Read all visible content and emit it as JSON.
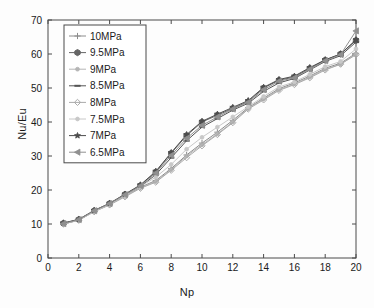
{
  "chart_data": {
    "type": "line",
    "title": "",
    "subtitle": "",
    "xlabel": "Np",
    "ylabel": "Nu/Eu",
    "xlim": [
      0,
      20
    ],
    "ylim": [
      0,
      70
    ],
    "xticks": [
      0,
      2,
      4,
      6,
      8,
      10,
      12,
      14,
      16,
      18,
      20
    ],
    "yticks": [
      0,
      10,
      20,
      30,
      40,
      50,
      60,
      70
    ],
    "grid": false,
    "legend_position": "upper-left-inside",
    "x": [
      1,
      2,
      3,
      4,
      5,
      6,
      7,
      8,
      9,
      10,
      11,
      12,
      13,
      14,
      15,
      16,
      17,
      18,
      19,
      20
    ],
    "series": [
      {
        "name": "10MPa",
        "marker": "plus",
        "color": "#8c8c8c",
        "values": [
          10.0,
          11.2,
          13.8,
          15.8,
          18.3,
          20.8,
          22.8,
          26.3,
          30.3,
          33.8,
          37.0,
          40.5,
          44.2,
          47.0,
          49.8,
          51.5,
          53.5,
          55.8,
          57.3,
          60.2
        ]
      },
      {
        "name": "9.5MPa",
        "marker": "hexagon",
        "color": "#666666",
        "values": [
          10.2,
          11.3,
          13.9,
          16.0,
          18.7,
          21.3,
          25.3,
          30.8,
          36.0,
          40.0,
          42.0,
          44.0,
          46.0,
          50.0,
          52.3,
          53.2,
          55.8,
          58.2,
          60.0,
          64.0
        ]
      },
      {
        "name": "9MPa",
        "marker": "dot",
        "color": "#b5b5b5",
        "values": [
          10.0,
          11.1,
          13.7,
          15.7,
          18.2,
          20.7,
          22.5,
          26.0,
          30.0,
          33.3,
          36.5,
          40.0,
          44.0,
          46.8,
          49.5,
          51.2,
          53.2,
          55.5,
          57.0,
          60.0
        ]
      },
      {
        "name": "8.5MPa",
        "marker": "line",
        "color": "#555555",
        "values": [
          10.1,
          11.2,
          13.8,
          15.9,
          18.5,
          21.0,
          24.5,
          29.5,
          34.5,
          38.5,
          41.0,
          43.5,
          45.5,
          49.0,
          51.5,
          52.8,
          55.3,
          57.8,
          59.5,
          63.5
        ]
      },
      {
        "name": "8MPa",
        "marker": "diamond",
        "color": "#aaaaaa",
        "values": [
          10.0,
          11.1,
          13.6,
          15.6,
          18.0,
          20.5,
          22.3,
          25.8,
          29.5,
          33.0,
          36.3,
          39.8,
          43.8,
          46.5,
          49.3,
          51.0,
          53.0,
          55.3,
          57.0,
          59.8
        ]
      },
      {
        "name": "7.5MPa",
        "marker": "dot-light",
        "color": "#c8c8c8",
        "values": [
          10.0,
          11.2,
          13.7,
          15.8,
          18.4,
          21.0,
          23.8,
          27.5,
          32.0,
          35.5,
          38.5,
          41.5,
          44.5,
          47.5,
          50.3,
          51.8,
          54.0,
          56.3,
          57.8,
          61.5
        ]
      },
      {
        "name": "7MPa",
        "marker": "star",
        "color": "#4d4d4d",
        "values": [
          10.3,
          11.4,
          14.0,
          16.1,
          18.8,
          21.5,
          25.5,
          31.0,
          36.3,
          40.2,
          42.3,
          44.3,
          46.3,
          50.2,
          52.5,
          53.5,
          56.0,
          58.3,
          60.0,
          64.2
        ]
      },
      {
        "name": "6.5MPa",
        "marker": "triangle-left",
        "color": "#909090",
        "values": [
          10.1,
          11.3,
          13.9,
          16.0,
          18.6,
          21.2,
          25.0,
          30.2,
          35.2,
          39.0,
          41.5,
          43.8,
          45.8,
          49.5,
          52.0,
          53.0,
          55.5,
          58.0,
          59.8,
          66.8
        ]
      }
    ]
  },
  "axes": {
    "xlabel": "Np",
    "ylabel": "Nu/Eu"
  }
}
